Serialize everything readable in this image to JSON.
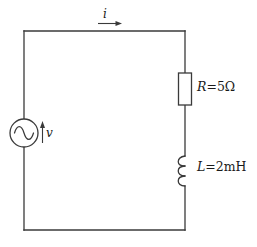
{
  "figure": {
    "background_color": "#ffffff",
    "line_color": "#3a3a3a",
    "text_color": "#1a1a1a"
  },
  "labels": {
    "current": {
      "symbol": "i",
      "text": "i",
      "arrow_direction": "right",
      "description": "loop current in top wire"
    },
    "voltage": {
      "symbol": "v",
      "text": "v",
      "arrow_direction": "up",
      "description": "source voltage across AC supply"
    },
    "resistor": {
      "symbol": "R",
      "equals": "=",
      "value": "5",
      "unit": "Ω",
      "text": "R=5Ω"
    },
    "inductor": {
      "symbol": "L",
      "equals": "=",
      "value": "2",
      "unit": "mH",
      "text": "L=2mH"
    }
  },
  "components": {
    "source": {
      "name": "ac-voltage-source",
      "symbol": "sine-wave-in-circle",
      "type": "AC"
    },
    "resistor": {
      "name": "resistor",
      "symbol": "rectangle-box",
      "type": "R"
    },
    "inductor": {
      "name": "inductor",
      "symbol": "coil-arcs",
      "type": "L",
      "coil_count": 3
    }
  },
  "geometry": {
    "left_x": 24,
    "right_x": 185,
    "top_y": 31,
    "bottom_y": 230
  }
}
